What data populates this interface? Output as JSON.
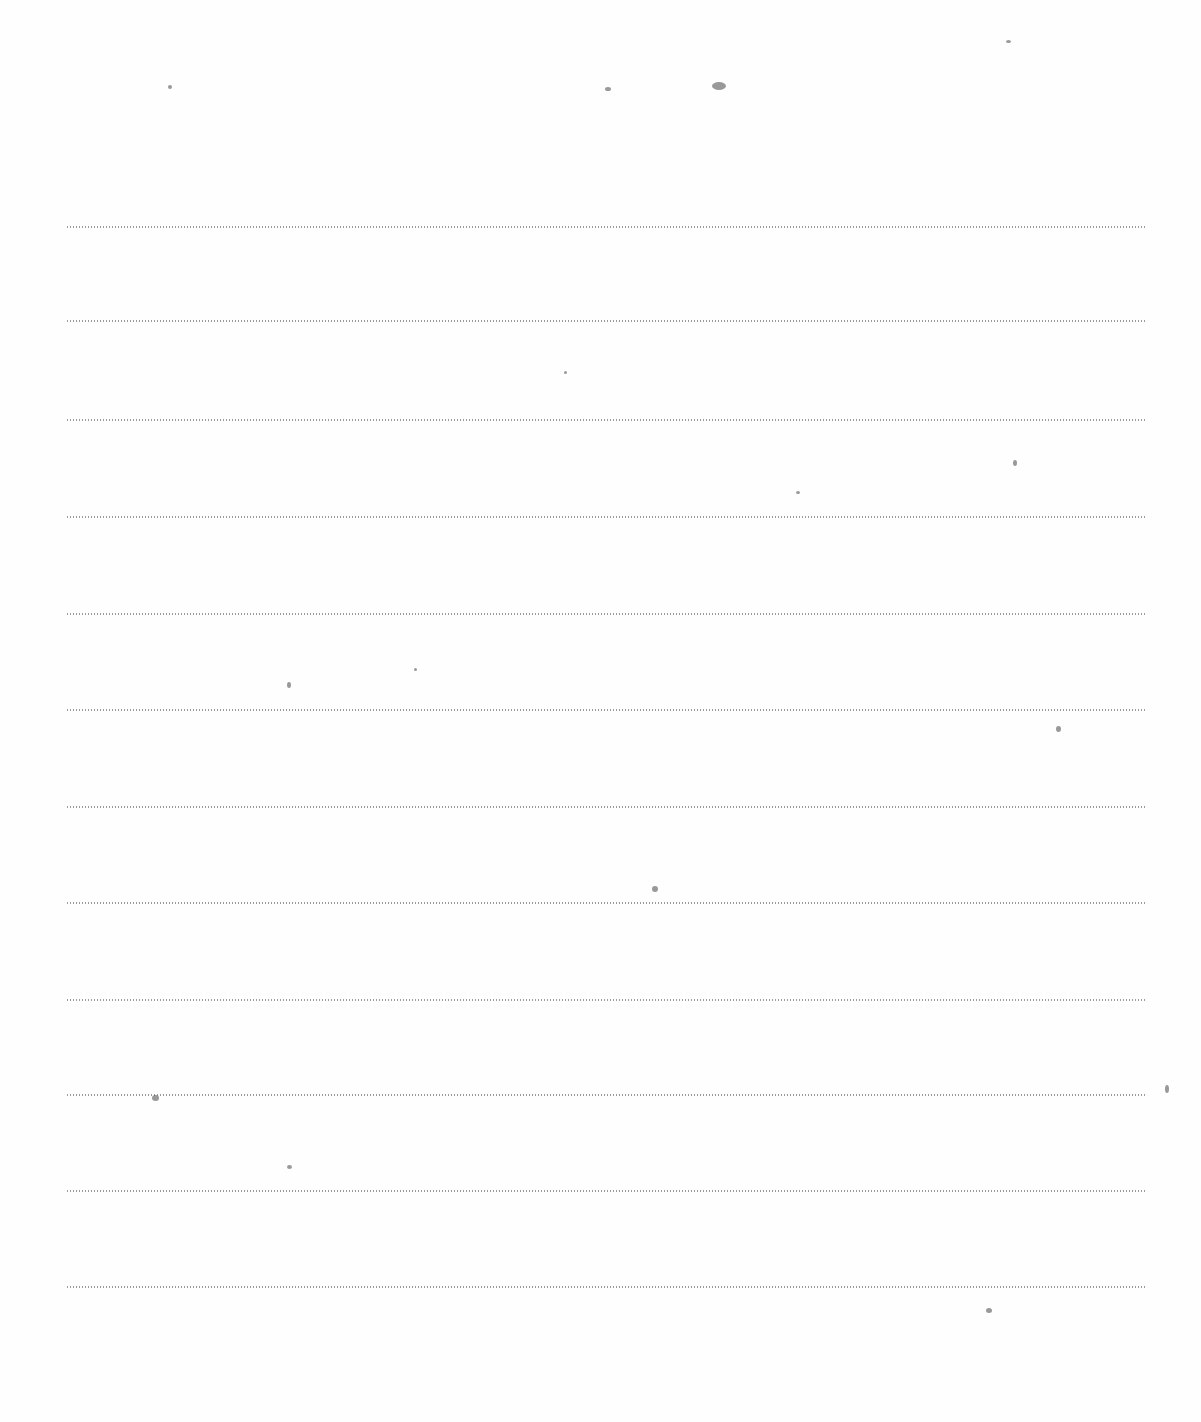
{
  "page": {
    "type": "blank lined sheet",
    "text": "",
    "rule_style": "dotted",
    "rule_color": "#8a8a8a",
    "rule_count": 12,
    "rule_positions_y": [
      226,
      320,
      419,
      516,
      613,
      709,
      806,
      902,
      999,
      1094,
      1190,
      1286
    ]
  },
  "specks": [
    {
      "x": 605,
      "y": 87,
      "w": 6,
      "h": 4
    },
    {
      "x": 712,
      "y": 82,
      "w": 14,
      "h": 8
    },
    {
      "x": 1006,
      "y": 40,
      "w": 5,
      "h": 3
    },
    {
      "x": 168,
      "y": 85,
      "w": 4,
      "h": 4
    },
    {
      "x": 564,
      "y": 371,
      "w": 3,
      "h": 3
    },
    {
      "x": 1013,
      "y": 460,
      "w": 4,
      "h": 6
    },
    {
      "x": 796,
      "y": 491,
      "w": 4,
      "h": 3
    },
    {
      "x": 287,
      "y": 682,
      "w": 4,
      "h": 6
    },
    {
      "x": 414,
      "y": 668,
      "w": 3,
      "h": 3
    },
    {
      "x": 1056,
      "y": 726,
      "w": 5,
      "h": 6
    },
    {
      "x": 652,
      "y": 886,
      "w": 6,
      "h": 6
    },
    {
      "x": 152,
      "y": 1095,
      "w": 7,
      "h": 6
    },
    {
      "x": 287,
      "y": 1165,
      "w": 5,
      "h": 4
    },
    {
      "x": 1165,
      "y": 1085,
      "w": 4,
      "h": 8
    },
    {
      "x": 986,
      "y": 1308,
      "w": 6,
      "h": 5
    }
  ]
}
